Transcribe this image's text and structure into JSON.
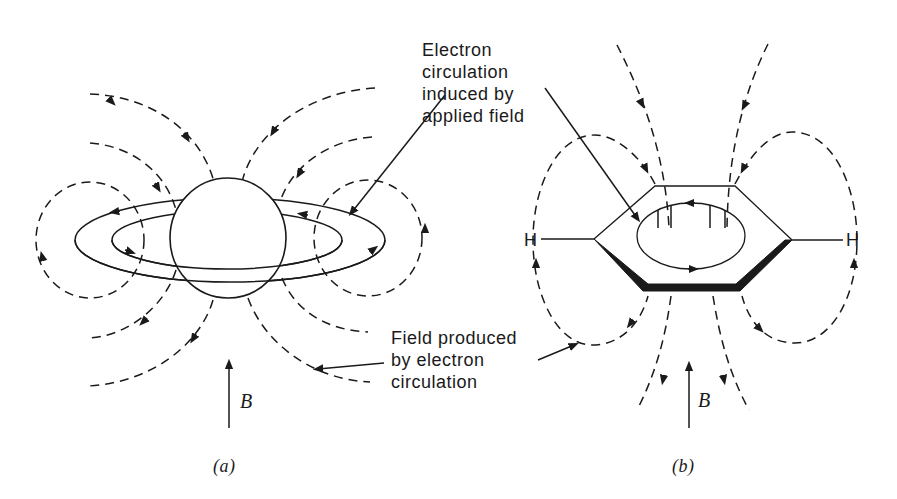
{
  "figure": {
    "panel_a": {
      "caption": "(a)",
      "field_label": "B",
      "description": "Sphere (atom) with induced ring current and dashed induced field lines"
    },
    "panel_b": {
      "caption": "(b)",
      "field_label": "B",
      "left_atom": "H",
      "right_atom": "H",
      "description": "Benzene ring with induced ring current and dashed induced field lines"
    },
    "annotations": {
      "ring_current": [
        "Electron",
        "circulation",
        "induced by",
        "applied field"
      ],
      "induced_field": [
        "Field produced",
        "by electron",
        "circulation"
      ]
    },
    "colors": {
      "ink": "#1a1a1a",
      "background": "#ffffff"
    }
  }
}
